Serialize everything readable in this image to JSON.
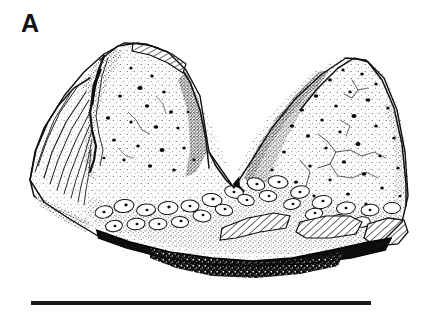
{
  "figure": {
    "panel_label": "A",
    "caption_text": "",
    "background_color": "#ffffff",
    "ink_color": "#111111",
    "width_px": 434,
    "height_px": 316
  },
  "specimen": {
    "name": "fossil-specimen-bicuspid",
    "description": "Stippled line drawing of a two-cusped fossil specimen in lateral view, showing a deep central notch, pitted enamel surfaces with scattered foramina, radiating striations on the left margin, a nodular rugose basal band, hatched broken-surface patches, and a dark shadowed ventral margin.",
    "rendering_style": "stipple-and-line ink illustration",
    "bounds": {
      "left": 30,
      "top": 42,
      "right": 409,
      "bottom": 266
    },
    "features": [
      {
        "name": "left-cusp",
        "label": "left cusp"
      },
      {
        "name": "right-cusp",
        "label": "right cusp"
      },
      {
        "name": "central-notch",
        "label": "central notch"
      },
      {
        "name": "striated-left-margin",
        "label": "striated left margin"
      },
      {
        "name": "rugose-basal-band",
        "label": "rugose basal band"
      },
      {
        "name": "hatched-break-surface-top",
        "label": "hatched break surface"
      },
      {
        "name": "hatched-break-surface-basal-left",
        "label": "hatched break surface"
      },
      {
        "name": "hatched-break-surface-basal-right",
        "label": "hatched break surface"
      },
      {
        "name": "shadowed-ventral-margin",
        "label": "shadowed ventral margin"
      }
    ]
  },
  "scale_bar": {
    "name": "scale-bar",
    "value_label": "",
    "color": "#1a1a1a",
    "left_px": 31,
    "top_px": 301,
    "length_px": 340,
    "thickness_px": 4
  }
}
